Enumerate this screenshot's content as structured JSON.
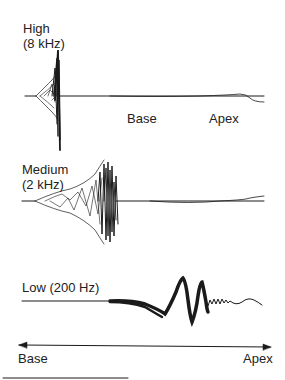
{
  "panels": {
    "high": {
      "label_line1": "High",
      "label_line2": "(8 kHz)",
      "base_label": "Base",
      "apex_label": "Apex"
    },
    "medium": {
      "label_line1": "Medium",
      "label_line2": "(2 kHz)"
    },
    "low": {
      "label": "Low (200 Hz)"
    }
  },
  "axis": {
    "left_label": "Base",
    "right_label": "Apex",
    "direction": "bidirectional-arrow"
  },
  "colors": {
    "ink": "#1a1a1a",
    "background": "#ffffff"
  }
}
